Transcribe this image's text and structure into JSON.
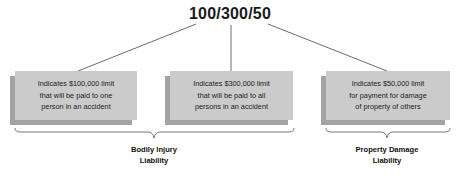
{
  "title": "100/300/50",
  "boxes": [
    {
      "line1": "Indicates $100,000 limit",
      "line2": "that will be paid to one",
      "line3": "person in an accident"
    },
    {
      "line1": "Indicates $300,000 limit",
      "line2": "that will be paid to all",
      "line3": "persons in an accident"
    },
    {
      "line1": "Indicates $50,000 limit",
      "line2": "for payment for damage",
      "line3": "of property of others"
    }
  ],
  "groups": [
    {
      "line1": "Bodily Injury",
      "line2": "Liability"
    },
    {
      "line1": "Property Damage",
      "line2": "Liability"
    }
  ],
  "colors": {
    "box_front": "#cbcbcb",
    "box_shadow": "#a3a3a3",
    "line": "#444444"
  }
}
